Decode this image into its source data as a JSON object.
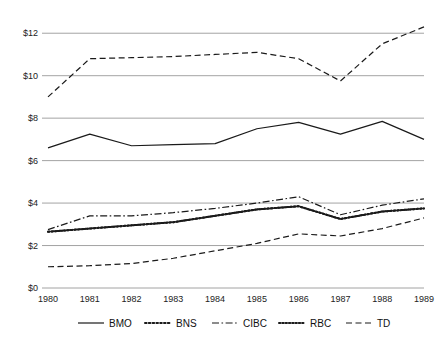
{
  "chart_data": {
    "type": "line",
    "title": "",
    "xlabel": "",
    "ylabel": "",
    "categories": [
      "1980",
      "1981",
      "1982",
      "1983",
      "1984",
      "1985",
      "1986",
      "1987",
      "1988",
      "1989"
    ],
    "ytick_labels": [
      "$0",
      "$2",
      "$4",
      "$6",
      "$8",
      "$10",
      "$12"
    ],
    "ytick_values": [
      0,
      2,
      4,
      6,
      8,
      10,
      12
    ],
    "ylim": [
      0,
      13
    ],
    "grid": false,
    "legend_position": "bottom",
    "series": [
      {
        "name": "BMO",
        "style": "solid",
        "values": [
          6.6,
          7.25,
          6.7,
          6.75,
          6.8,
          7.5,
          7.8,
          7.25,
          7.85,
          7.0
        ]
      },
      {
        "name": "BNS",
        "style": "dotted",
        "values": [
          2.65,
          2.8,
          2.95,
          3.1,
          3.4,
          3.7,
          3.85,
          3.25,
          3.6,
          3.75
        ]
      },
      {
        "name": "CIBC",
        "style": "dash-dot",
        "values": [
          2.75,
          3.4,
          3.4,
          3.55,
          3.75,
          4.0,
          4.3,
          3.45,
          3.9,
          4.2
        ]
      },
      {
        "name": "RBC",
        "style": "dot-dense",
        "values": [
          2.65,
          2.8,
          2.95,
          3.1,
          3.4,
          3.7,
          3.85,
          3.25,
          3.6,
          3.75
        ]
      },
      {
        "name": "TD",
        "style": "dashed",
        "values": [
          1.0,
          1.05,
          1.15,
          1.4,
          1.75,
          2.1,
          2.55,
          2.45,
          2.8,
          3.3
        ]
      },
      {
        "name": "TOP",
        "style": "dashed",
        "values": [
          9.0,
          10.8,
          10.85,
          10.9,
          11.0,
          11.1,
          10.8,
          9.75,
          11.5,
          12.3
        ]
      }
    ],
    "legend": [
      {
        "label": "BMO",
        "style": "solid"
      },
      {
        "label": "BNS",
        "style": "dotted"
      },
      {
        "label": "CIBC",
        "style": "dash-dot"
      },
      {
        "label": "RBC",
        "style": "dot-dense"
      },
      {
        "label": "TD",
        "style": "dashed"
      }
    ],
    "colors": {
      "line": "#1a1a1a",
      "axis": "#555555",
      "text": "#222222"
    }
  }
}
